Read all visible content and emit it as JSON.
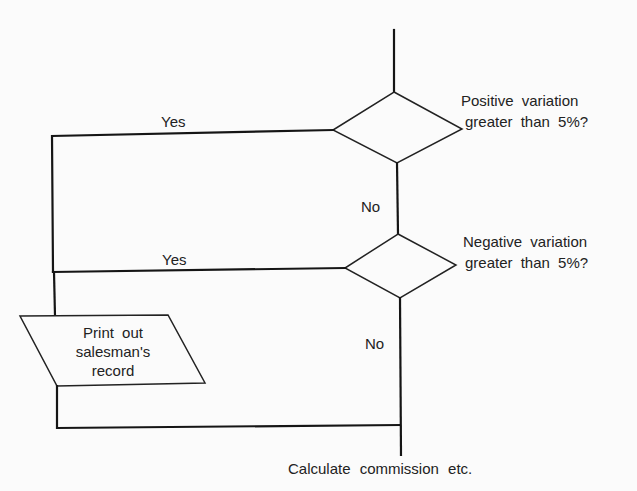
{
  "diagram": {
    "type": "flowchart",
    "decisions": [
      {
        "id": "d1",
        "line1": "Positive variation",
        "line2": "greater than 5%?",
        "yes_label": "Yes",
        "no_label": "No"
      },
      {
        "id": "d2",
        "line1": "Negative variation",
        "line2": "greater than 5%?",
        "yes_label": "Yes",
        "no_label": "No"
      }
    ],
    "io_box": {
      "line1": "Print out",
      "line2": "salesman's",
      "line3": "record"
    },
    "terminal_text": "Calculate commission etc.",
    "colors": {
      "line": "#151515",
      "background": "#fbfbfb"
    }
  }
}
